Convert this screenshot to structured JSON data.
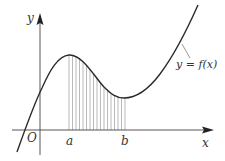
{
  "diagram": {
    "type": "function-graph-with-shaded-area",
    "labels": {
      "y_axis": "y",
      "x_axis": "x",
      "origin": "O",
      "lower_bound": "a",
      "upper_bound": "b",
      "curve": "y = f(x)"
    },
    "colors": {
      "axis": "#444444",
      "curve": "#2a2a2a",
      "hatch": "#888888",
      "text": "#333333",
      "background": "#ffffff"
    }
  }
}
